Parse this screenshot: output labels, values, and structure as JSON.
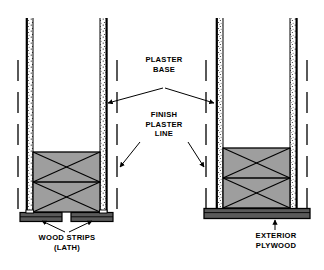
{
  "diagram": {
    "type": "technical-section-diagram",
    "background_color": "#ffffff",
    "line_color": "#000000",
    "stud_fill_color": "#9e9e9e",
    "plate_fill_color": "#5a5a5a",
    "plaster_fill_color": "#ffffff"
  },
  "labels": {
    "plaster_base": "PLASTER\nBASE",
    "finish_plaster_line": "FINISH\nPLASTER\nLINE",
    "wood_strips": "WOOD STRIPS\n(LATH)",
    "exterior_plywood": "EXTERIOR\nPLYWOOD"
  },
  "assemblies": [
    {
      "name": "left-assembly",
      "base_type": "wood-strips-lath",
      "stud_braces": 2,
      "plaster_columns": 2
    },
    {
      "name": "right-assembly",
      "base_type": "exterior-plywood",
      "stud_braces": 2,
      "plaster_columns": 2
    }
  ],
  "callouts": [
    {
      "name": "plaster-base-callout",
      "label_key": "plaster_base",
      "arrow_count": 2,
      "points_to": [
        "left-assembly-inner-plaster",
        "right-assembly-inner-plaster"
      ]
    },
    {
      "name": "finish-plaster-line-callout",
      "label_key": "finish_plaster_line",
      "arrow_count": 2,
      "points_to": [
        "left-assembly-finish-line",
        "right-assembly-finish-line"
      ]
    },
    {
      "name": "wood-strips-callout",
      "label_key": "wood_strips",
      "arrow_count": 2,
      "points_to": [
        "left-lath-strip-1",
        "left-lath-strip-2"
      ]
    },
    {
      "name": "exterior-plywood-callout",
      "label_key": "exterior_plywood",
      "arrow_count": 1,
      "points_to": [
        "right-plywood-plate"
      ]
    }
  ]
}
